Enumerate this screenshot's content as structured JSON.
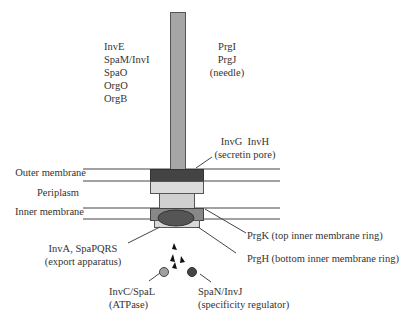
{
  "colors": {
    "needle": "#a6a6a6",
    "needle_border": "#555555",
    "outer_ring": "#444444",
    "light_ring": "#dcdcdc",
    "periplasm_rod": "#d0d0d0",
    "inner_ring": "#888888",
    "export_oval": "#555555",
    "bottom_ring": "#d8d8d8",
    "atpase": "#a0a0a0",
    "regulator": "#444444",
    "line": "#444444"
  },
  "labels": {
    "needle_left": [
      "InvE",
      "SpaM/InvI",
      "SpaO",
      "OrgO",
      "OrgB"
    ],
    "needle_right": [
      "PrgI",
      "PrgJ",
      "(needle)"
    ],
    "secretin": [
      "InvG  InvH",
      "(secretin pore)"
    ],
    "outer_membrane": "Outer membrane",
    "periplasm": "Periplasm",
    "inner_membrane": "Inner membrane",
    "prgk": "PrgK (top inner membrane ring)",
    "prgh": "PrgH (bottom inner membrane ring)",
    "export": [
      "InvA, SpaPQRS",
      "(export apparatus)"
    ],
    "atpase": [
      "InvC/SpaL",
      "(ATPase)"
    ],
    "regulator": [
      "SpaN/InvJ",
      "(specificity regulator)"
    ]
  }
}
